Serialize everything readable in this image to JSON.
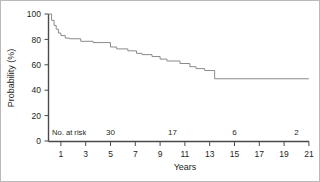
{
  "chart_data": {
    "type": "line",
    "subtype": "kaplan-meier-survival-step",
    "title": "",
    "xlabel": "Years",
    "ylabel": "Probability (%)",
    "xlim": [
      0,
      21
    ],
    "ylim": [
      0,
      100
    ],
    "grid": false,
    "legend": null,
    "xticks": [
      1,
      3,
      5,
      7,
      9,
      11,
      13,
      15,
      17,
      19,
      21
    ],
    "xtick_labels": [
      "1",
      "3",
      "5",
      "7",
      "9",
      "11",
      "13",
      "15",
      "17",
      "19",
      "21"
    ],
    "yticks": [
      0,
      20,
      40,
      60,
      80,
      100
    ],
    "ytick_labels": [
      "0",
      "20",
      "40",
      "60",
      "80",
      "100"
    ],
    "series": [
      {
        "name": "Survival probability",
        "color": "#8a8a8a",
        "x": [
          0.0,
          0.25,
          0.25,
          0.45,
          0.45,
          0.62,
          0.62,
          0.8,
          0.8,
          1.0,
          1.0,
          1.35,
          1.35,
          1.7,
          1.7,
          2.6,
          2.6,
          3.6,
          3.6,
          5.0,
          5.0,
          5.5,
          5.5,
          6.4,
          6.4,
          7.1,
          7.1,
          7.55,
          7.55,
          8.35,
          8.35,
          9.0,
          9.0,
          9.55,
          9.55,
          10.6,
          10.6,
          11.4,
          11.4,
          11.9,
          11.9,
          12.6,
          12.6,
          13.4,
          13.4,
          21.0
        ],
        "y": [
          100,
          100,
          95,
          95,
          91,
          91,
          88,
          88,
          85,
          85,
          83,
          83,
          81,
          81,
          80.5,
          80.5,
          78.5,
          78.5,
          77.5,
          77.5,
          74,
          74,
          72.5,
          72.5,
          71,
          71,
          69,
          69,
          68,
          68,
          66.5,
          66.5,
          64.5,
          64.5,
          63,
          63,
          61,
          61,
          58.5,
          58.5,
          57,
          57,
          55.5,
          55.5,
          49,
          49
        ]
      }
    ],
    "at_risk": {
      "label": "No. at risk",
      "x": [
        5,
        10,
        15,
        20
      ],
      "values": [
        "30",
        "17",
        "6",
        "2"
      ]
    }
  }
}
